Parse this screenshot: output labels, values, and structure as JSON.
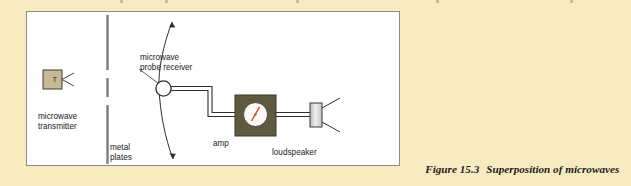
{
  "page": {
    "background_color": "#f7ecc0",
    "panel_color": "#ffffff",
    "panel_border_color": "#8d8d85"
  },
  "figure": {
    "caption_number": "Figure 15.3",
    "caption_text": "Superposition of microwaves"
  },
  "diagram": {
    "type": "physics-apparatus-schematic",
    "title": "Superposition of microwaves",
    "components": [
      {
        "id": "microwave-transmitter",
        "label": "microwave\ntransmitter",
        "symbol_text": "T",
        "shape": "square",
        "fill_color": "#c8b894",
        "stroke_color": "#3a3a3a",
        "has_antenna": true,
        "antenna_count": 2
      },
      {
        "id": "metal-plates",
        "label": "metal\nplates",
        "shape": "vertical-segmented-line",
        "stroke_color": "#7c7c7c",
        "segments": 3,
        "slits": 2
      },
      {
        "id": "microwave-probe-receiver",
        "label": "microwave\nprobe receiver",
        "shape": "circle",
        "fill_color": "#ffffff",
        "stroke_color": "#2e2e2e",
        "motion_arc": "double-headed-vertical-scan"
      },
      {
        "id": "amp",
        "label": "amp",
        "shape": "square-meter-box",
        "fill_color": "#5f5a3e",
        "dial_color": "#fbfaf3",
        "needle_color": "#c8502a"
      },
      {
        "id": "loudspeaker",
        "label": "loudspeaker",
        "shape": "vertical-rectangle",
        "fill_color": "#d4d4d4",
        "stroke_color": "#3a3a3a",
        "sound_lines": 2
      }
    ],
    "connections": [
      {
        "from": "microwave-probe-receiver",
        "to": "amp",
        "style": "twin-line-cable"
      },
      {
        "from": "amp",
        "to": "loudspeaker",
        "style": "twin-line-cable"
      }
    ],
    "labels": {
      "transmitter": "microwave\ntransmitter",
      "plates": "metal\nplates",
      "probe": "microwave\nprobe receiver",
      "amp": "amp",
      "loudspeaker": "loudspeaker",
      "transmitter_symbol": "T"
    }
  }
}
